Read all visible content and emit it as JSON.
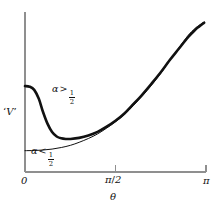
{
  "figure": {
    "background_color": "#ffffff",
    "ink_color": "#111111",
    "axis_color": "#8c8c8c"
  },
  "axes": {
    "y_axis_label": "'V'",
    "y_axis_label_parts": {
      "open_quote": "‘",
      "symbol": "V",
      "close_quote": "’"
    },
    "x_axis_label": "θ",
    "x_ticks": [
      {
        "label": "0",
        "value": 0
      },
      {
        "label": "π/2",
        "value": 1.5707963,
        "numerator": "π",
        "denominator": "2"
      },
      {
        "label": "π",
        "value": 3.1415927
      }
    ],
    "x_range": [
      0,
      3.1415927
    ],
    "y_ticks": [],
    "grid": false
  },
  "annotations": [
    {
      "id": "alpha-greater-half",
      "text": "α > 1/2",
      "symbol": "α",
      "relation": ">",
      "numerator": "1",
      "denominator": "2",
      "x_px": 52,
      "y_px": 90
    },
    {
      "id": "alpha-less-half",
      "text": "α < 1/2",
      "symbol": "α",
      "relation": "<",
      "numerator": "1",
      "denominator": "2",
      "x_px": 31,
      "y_px": 152
    }
  ],
  "chart_data": {
    "type": "line",
    "title": "",
    "xlabel": "θ",
    "ylabel": "'V'",
    "xlim": [
      0,
      3.1415927
    ],
    "ylim": [
      0,
      1
    ],
    "grid": false,
    "legend_position": "inline-annotations",
    "xtick_labels": [
      "0",
      "π/2",
      "π"
    ],
    "xtick_values": [
      0,
      1.5707963,
      3.1415927
    ],
    "ytick_labels": [],
    "series": [
      {
        "name": "α > 1/2",
        "style": "thick",
        "linewidth_px": 2.6,
        "color": "#111111",
        "comment": "Starts high at theta=0, falls steeply to a shallow minimum near theta~0.5, then rises steeply toward pi",
        "x": [
          0.0,
          0.08,
          0.16,
          0.24,
          0.31,
          0.39,
          0.47,
          0.55,
          0.63,
          0.71,
          0.79,
          0.94,
          1.1,
          1.26,
          1.41,
          1.57,
          1.73,
          1.88,
          2.04,
          2.2,
          2.36,
          2.51,
          2.67,
          2.83,
          2.95,
          3.02,
          3.08,
          3.11
        ],
        "y": [
          0.544,
          0.54,
          0.52,
          0.463,
          0.383,
          0.306,
          0.253,
          0.225,
          0.213,
          0.209,
          0.209,
          0.216,
          0.231,
          0.254,
          0.285,
          0.324,
          0.372,
          0.429,
          0.492,
          0.561,
          0.633,
          0.707,
          0.78,
          0.853,
          0.898,
          0.92,
          0.937,
          0.945
        ]
      },
      {
        "name": "α < 1/2",
        "style": "thin",
        "linewidth_px": 1.0,
        "color": "#111111",
        "comment": "Starts low and flat at theta=0 and rises monotonically, crossing the thick curve near theta~1.5 and converging at pi",
        "x": [
          0.0,
          0.16,
          0.31,
          0.47,
          0.63,
          0.79,
          0.94,
          1.1,
          1.26,
          1.41,
          1.57,
          1.73,
          1.88,
          2.04,
          2.2,
          2.36,
          2.51,
          2.67,
          2.83,
          2.95,
          3.02,
          3.08,
          3.11
        ],
        "y": [
          0.135,
          0.136,
          0.139,
          0.145,
          0.155,
          0.169,
          0.188,
          0.212,
          0.241,
          0.276,
          0.317,
          0.365,
          0.42,
          0.482,
          0.551,
          0.626,
          0.705,
          0.786,
          0.864,
          0.908,
          0.928,
          0.942,
          0.948
        ]
      }
    ]
  }
}
